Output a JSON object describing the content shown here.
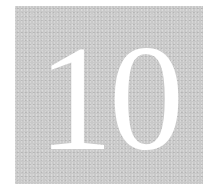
{
  "chapter": {
    "number": "10",
    "tile_color": "#c9c9c9",
    "text_color": "#ffffff"
  }
}
